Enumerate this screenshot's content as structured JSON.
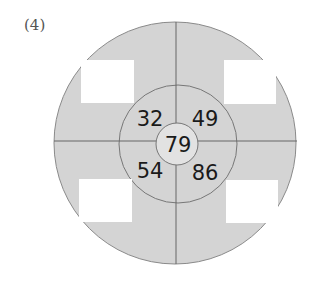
{
  "problem_label": "(4)",
  "diagram": {
    "colors": {
      "fill": "#d4d4d4",
      "inner_fill": "#e2e2e2",
      "stroke": "#777777",
      "box_fill": "#ffffff"
    },
    "center_value": "79",
    "middle_ring_values": {
      "top_left": "32",
      "top_right": "49",
      "bottom_left": "54",
      "bottom_right": "86"
    },
    "outer_answer_boxes": {
      "top_left": "",
      "top_right": "",
      "bottom_left": "",
      "bottom_right": ""
    }
  }
}
